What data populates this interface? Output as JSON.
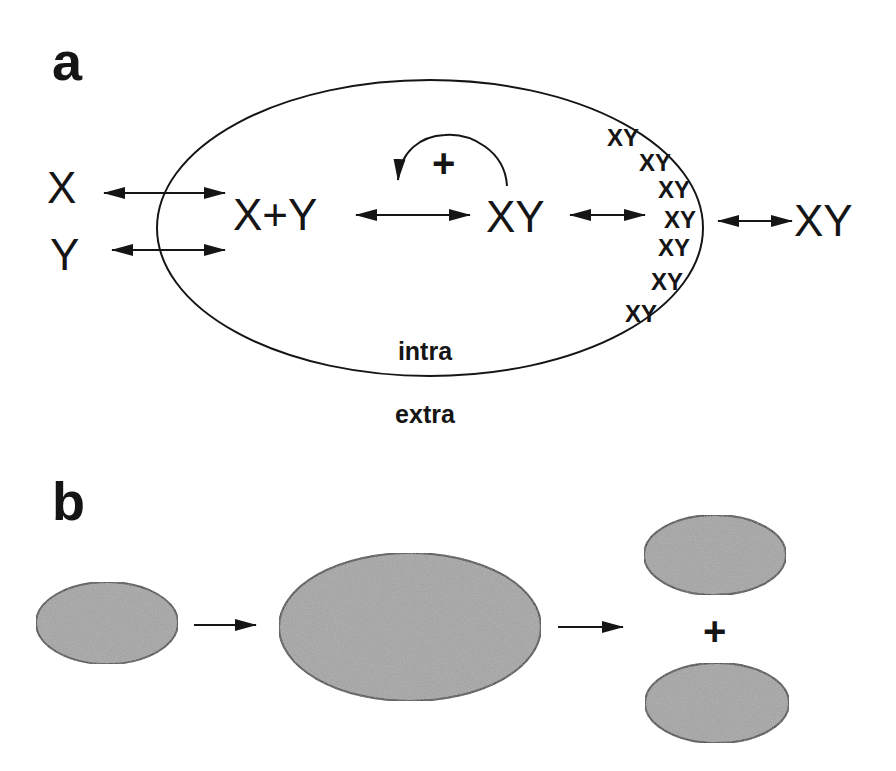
{
  "panel_a": {
    "label": "a",
    "membrane_inner_label": "intra",
    "membrane_outer_label": "extra",
    "outside_species": [
      "X",
      "Y"
    ],
    "inside_reactants": "X+Y",
    "inside_product": "XY",
    "feedback_sign": "+",
    "membrane_bound_label": "XY",
    "membrane_bound_count": 7,
    "released_product": "XY"
  },
  "panel_b": {
    "label": "b",
    "division_sign": "+"
  },
  "colors": {
    "ink": "#151515",
    "cell_fill": "#9a9a9a",
    "background": "#ffffff"
  }
}
